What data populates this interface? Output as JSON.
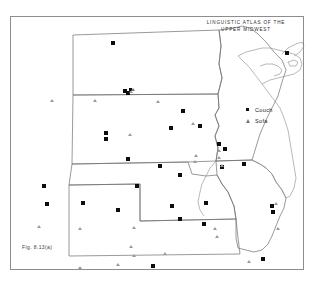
{
  "figure": {
    "title_line1": "LINGUISTIC ATLAS OF THE",
    "title_line2": "UPPER MIDWEST",
    "caption": "Fig. 8.13(a)",
    "top_cut_text": ""
  },
  "legend": {
    "items": [
      {
        "symbol": "filled-square",
        "label": "Couch"
      },
      {
        "symbol": "triangle",
        "label": "Sofa"
      }
    ]
  },
  "colors": {
    "couch_marker": "#0d0d0d",
    "sofa_marker": "#9a9a9a",
    "state_border": "#6f6f6f",
    "coastline": "#8a8a8a",
    "frame": "#8d8d8d",
    "background": "#ffffff"
  },
  "map": {
    "region": "Upper Midwest",
    "states": [
      "North Dakota",
      "South Dakota",
      "Nebraska",
      "Kansas",
      "Minnesota",
      "Iowa",
      "Wisconsin"
    ],
    "water_features": [
      "Lake Superior"
    ]
  },
  "markers": {
    "couch": [
      {
        "x": 103,
        "y": 27
      },
      {
        "x": 277,
        "y": 37
      },
      {
        "x": 115,
        "y": 75
      },
      {
        "x": 173,
        "y": 95
      },
      {
        "x": 161,
        "y": 112
      },
      {
        "x": 190,
        "y": 110
      },
      {
        "x": 96,
        "y": 117
      },
      {
        "x": 96,
        "y": 123
      },
      {
        "x": 118,
        "y": 143
      },
      {
        "x": 150,
        "y": 150
      },
      {
        "x": 170,
        "y": 159
      },
      {
        "x": 34,
        "y": 170
      },
      {
        "x": 127,
        "y": 170
      },
      {
        "x": 209,
        "y": 128
      },
      {
        "x": 215,
        "y": 133
      },
      {
        "x": 212,
        "y": 151
      },
      {
        "x": 234,
        "y": 148
      },
      {
        "x": 37,
        "y": 188
      },
      {
        "x": 73,
        "y": 187
      },
      {
        "x": 108,
        "y": 194
      },
      {
        "x": 196,
        "y": 187
      },
      {
        "x": 162,
        "y": 190
      },
      {
        "x": 170,
        "y": 203
      },
      {
        "x": 194,
        "y": 208
      },
      {
        "x": 262,
        "y": 190
      },
      {
        "x": 263,
        "y": 196
      },
      {
        "x": 143,
        "y": 250
      },
      {
        "x": 253,
        "y": 243
      },
      {
        "x": 118,
        "y": 77
      }
    ],
    "sofa": [
      {
        "x": 42,
        "y": 85
      },
      {
        "x": 85,
        "y": 85
      },
      {
        "x": 148,
        "y": 86
      },
      {
        "x": 120,
        "y": 119
      },
      {
        "x": 121,
        "y": 76
      },
      {
        "x": 186,
        "y": 140
      },
      {
        "x": 209,
        "y": 135
      },
      {
        "x": 209,
        "y": 142
      },
      {
        "x": 212,
        "y": 150
      },
      {
        "x": 266,
        "y": 188
      },
      {
        "x": 268,
        "y": 213
      },
      {
        "x": 205,
        "y": 213
      },
      {
        "x": 207,
        "y": 221
      },
      {
        "x": 29,
        "y": 211
      },
      {
        "x": 70,
        "y": 213
      },
      {
        "x": 124,
        "y": 212
      },
      {
        "x": 121,
        "y": 231
      },
      {
        "x": 124,
        "y": 240
      },
      {
        "x": 155,
        "y": 238
      },
      {
        "x": 108,
        "y": 249
      },
      {
        "x": 70,
        "y": 252
      },
      {
        "x": 183,
        "y": 108
      },
      {
        "x": 185,
        "y": 146
      },
      {
        "x": 239,
        "y": 246
      }
    ],
    "combined": [
      {
        "x": 122,
        "y": 74
      }
    ]
  }
}
